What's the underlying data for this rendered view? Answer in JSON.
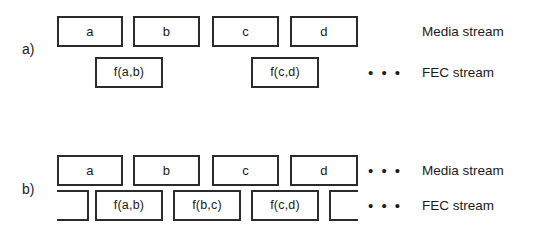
{
  "figure": {
    "panels": [
      {
        "id": "a",
        "label": "a)",
        "rows": [
          {
            "id": "media",
            "stream_label": "Media stream",
            "ellipsis": "",
            "boxes": [
              {
                "text": "a",
                "x": 57,
                "width": 66,
                "clip": "none"
              },
              {
                "text": "b",
                "x": 133,
                "width": 67,
                "clip": "none"
              },
              {
                "text": "c",
                "x": 212,
                "width": 67,
                "clip": "none"
              },
              {
                "text": "d",
                "x": 290,
                "width": 68,
                "clip": "none"
              }
            ]
          },
          {
            "id": "fec",
            "stream_label": "FEC stream",
            "ellipsis": "• • •",
            "boxes": [
              {
                "text": "f(a,b)",
                "x": 95,
                "width": 68,
                "clip": "none"
              },
              {
                "text": "f(c,d)",
                "x": 251,
                "width": 68,
                "clip": "none"
              }
            ]
          }
        ]
      },
      {
        "id": "b",
        "label": "b)",
        "rows": [
          {
            "id": "media",
            "stream_label": "Media stream",
            "ellipsis": "• • •",
            "boxes": [
              {
                "text": "a",
                "x": 57,
                "width": 66,
                "clip": "none"
              },
              {
                "text": "b",
                "x": 133,
                "width": 67,
                "clip": "none"
              },
              {
                "text": "c",
                "x": 212,
                "width": 67,
                "clip": "none"
              },
              {
                "text": "d",
                "x": 290,
                "width": 68,
                "clip": "none"
              }
            ]
          },
          {
            "id": "fec",
            "stream_label": "FEC stream",
            "ellipsis": "• • •",
            "boxes": [
              {
                "text": "",
                "x": 57,
                "width": 32,
                "clip": "left"
              },
              {
                "text": "f(a,b)",
                "x": 95,
                "width": 68,
                "clip": "none"
              },
              {
                "text": "f(b,c)",
                "x": 173,
                "width": 68,
                "clip": "none"
              },
              {
                "text": "f(c,d)",
                "x": 251,
                "width": 68,
                "clip": "none"
              },
              {
                "text": "",
                "x": 329,
                "width": 29,
                "clip": "right"
              }
            ]
          }
        ]
      }
    ],
    "layout": {
      "panel_label_x": 22,
      "ellipsis_x": 368,
      "stream_label_x": 422
    }
  }
}
